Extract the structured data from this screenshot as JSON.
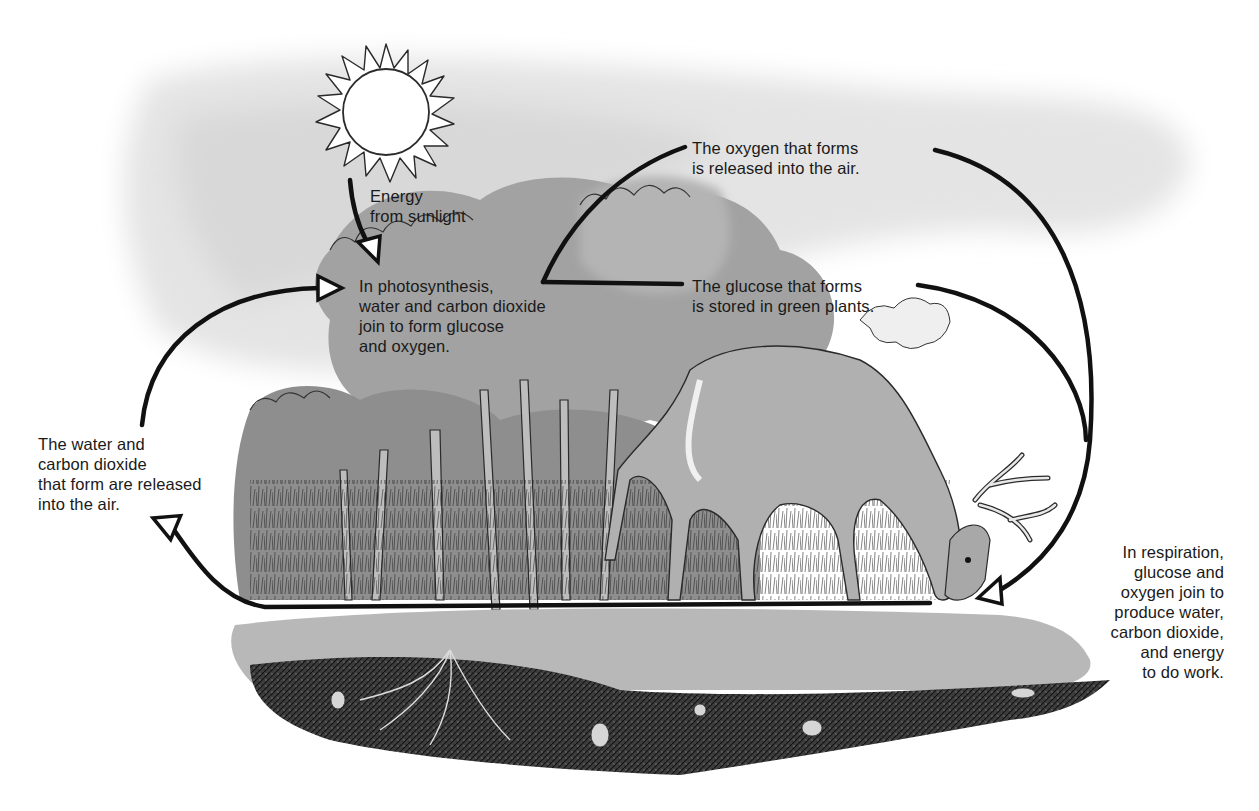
{
  "diagram": {
    "type": "cycle",
    "topic": "Photosynthesis and respiration cycle",
    "colors": {
      "background": "#ffffff",
      "sky_wash": "#e6e6e6",
      "foliage": "#9a9a9a",
      "ground": "#a8a8a8",
      "soil": "#3a3a3a",
      "arrow": "#111111",
      "text": "#1a1a1a"
    },
    "illustration": {
      "sun": "sun-icon",
      "trees": "forest-illustration",
      "deer": "deer-illustration",
      "soil": "soil-cross-section"
    },
    "labels": {
      "energy": "Energy\nfrom sunlight",
      "photosynthesis": "In photosynthesis,\nwater and carbon dioxide\njoin to form glucose\nand oxygen.",
      "oxygen": "The oxygen that forms\nis released into the air.",
      "glucose": "The glucose that forms\nis stored in green plants.",
      "water_co2": "The water and\ncarbon dioxide\nthat form are released\ninto the air.",
      "respiration": "In respiration,\nglucose and\noxygen join to\nproduce water,\ncarbon dioxide,\nand energy\nto do work."
    },
    "arrows": [
      {
        "from": "sun",
        "to": "photosynthesis"
      },
      {
        "from": "photosynthesis",
        "to": "oxygen"
      },
      {
        "from": "photosynthesis",
        "to": "glucose"
      },
      {
        "from": "oxygen",
        "to": "respiration"
      },
      {
        "from": "glucose",
        "to": "respiration"
      },
      {
        "from": "respiration",
        "to": "water_co2"
      },
      {
        "from": "water_co2",
        "to": "photosynthesis"
      }
    ]
  }
}
